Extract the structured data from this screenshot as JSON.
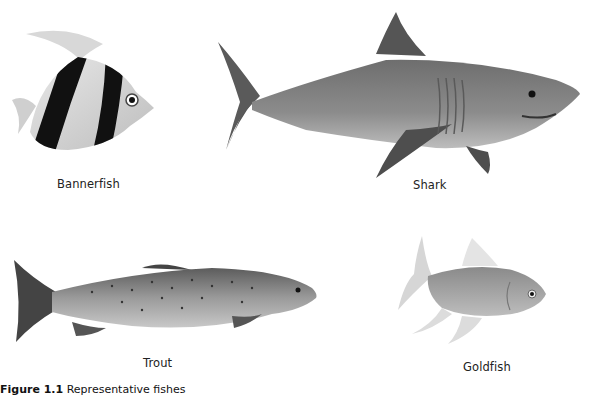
{
  "figure": {
    "fishes": [
      {
        "name": "Bannerfish",
        "label": "Bannerfish"
      },
      {
        "name": "Shark",
        "label": "Shark"
      },
      {
        "name": "Trout",
        "label": "Trout"
      },
      {
        "name": "Goldfish",
        "label": "Goldfish"
      }
    ],
    "caption": {
      "number": "Figure 1.1",
      "text": "Representative fishes"
    }
  }
}
